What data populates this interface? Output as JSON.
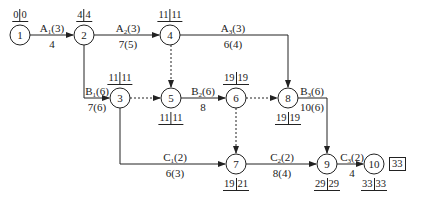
{
  "nodes": [
    {
      "id": "1",
      "x": 20,
      "y": 35,
      "et": "0",
      "lt": "0",
      "times_pos": "top"
    },
    {
      "id": "2",
      "x": 84,
      "y": 35,
      "et": "4",
      "lt": "4",
      "times_pos": "top"
    },
    {
      "id": "4",
      "x": 170,
      "y": 35,
      "et": "11",
      "lt": "11",
      "times_pos": "top"
    },
    {
      "id": "3",
      "x": 120,
      "y": 98,
      "et": "11",
      "lt": "11",
      "times_pos": "top"
    },
    {
      "id": "5",
      "x": 171,
      "y": 98,
      "et": "11",
      "lt": "11",
      "times_pos": "bottom"
    },
    {
      "id": "6",
      "x": 236,
      "y": 98,
      "et": "19",
      "lt": "19",
      "times_pos": "top"
    },
    {
      "id": "8",
      "x": 288,
      "y": 98,
      "et": "19",
      "lt": "19",
      "times_pos": "bottom"
    },
    {
      "id": "7",
      "x": 236,
      "y": 164,
      "et": "19",
      "lt": "21",
      "times_pos": "bottom"
    },
    {
      "id": "9",
      "x": 327,
      "y": 164,
      "et": "29",
      "lt": "29",
      "times_pos": "bottom"
    },
    {
      "id": "10",
      "x": 374,
      "y": 164,
      "et": "33",
      "lt": "33",
      "times_pos": "bottom"
    }
  ],
  "activities": [
    {
      "name": "A",
      "sub": "1",
      "resource": "(3)",
      "duration": "4",
      "from": "1",
      "to": "2"
    },
    {
      "name": "A",
      "sub": "2",
      "resource": "(3)",
      "duration": "7(5)",
      "from": "2",
      "to": "4"
    },
    {
      "name": "A",
      "sub": "3",
      "resource": "(3)",
      "duration": "6(4)",
      "from": "4",
      "to": "8"
    },
    {
      "name": "B",
      "sub": "1",
      "resource": "(6)",
      "duration": "7(6)",
      "from": "2",
      "to": "3"
    },
    {
      "name": "B",
      "sub": "2",
      "resource": "(6)",
      "duration": "8",
      "from": "5",
      "to": "6"
    },
    {
      "name": "B",
      "sub": "3",
      "resource": "(6)",
      "duration": "10(6)",
      "from": "8",
      "to": "9"
    },
    {
      "name": "C",
      "sub": "1",
      "resource": "(2)",
      "duration": "6(3)",
      "from": "3",
      "to": "7"
    },
    {
      "name": "C",
      "sub": "2",
      "resource": "(2)",
      "duration": "8(4)",
      "from": "7",
      "to": "9"
    },
    {
      "name": "C",
      "sub": "3",
      "resource": "(2)",
      "duration": "4",
      "from": "9",
      "to": "10"
    }
  ],
  "dummy_activities": [
    {
      "from": "4",
      "to": "5"
    },
    {
      "from": "3",
      "to": "5"
    },
    {
      "from": "6",
      "to": "8"
    },
    {
      "from": "6",
      "to": "7"
    }
  ],
  "project_duration": "33",
  "colors": {
    "line": "#222222",
    "background": "#ffffff"
  }
}
